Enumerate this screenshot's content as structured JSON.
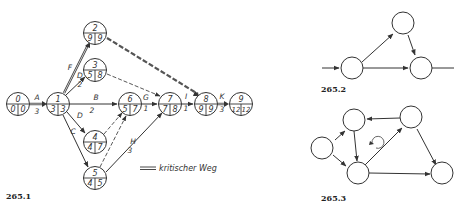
{
  "figures": [
    {
      "id": "265.1",
      "caption": "265.1",
      "legend": {
        "symbol": "double-line",
        "label": "kritischer Weg"
      },
      "nodes": [
        {
          "n": "0",
          "early": "0",
          "late": "0"
        },
        {
          "n": "1",
          "early": "3",
          "late": "3"
        },
        {
          "n": "2",
          "early": "9",
          "late": "9"
        },
        {
          "n": "3",
          "early": "5",
          "late": "8"
        },
        {
          "n": "4",
          "early": "4",
          "late": "7"
        },
        {
          "n": "5",
          "early": "4",
          "late": "5"
        },
        {
          "n": "6",
          "early": "5",
          "late": "7"
        },
        {
          "n": "7",
          "early": "7",
          "late": "8"
        },
        {
          "n": "8",
          "early": "9",
          "late": "9"
        },
        {
          "n": "9",
          "early": "12",
          "late": "12"
        }
      ],
      "activities": [
        {
          "name": "A",
          "duration": "3",
          "from": "0",
          "to": "1",
          "critical": true
        },
        {
          "name": "F",
          "duration": "",
          "from": "1",
          "to": "2",
          "critical": true
        },
        {
          "name": "D",
          "duration": "2",
          "from": "1",
          "to": "3",
          "critical": false
        },
        {
          "name": "B",
          "duration": "2",
          "from": "1",
          "to": "6",
          "critical": false
        },
        {
          "name": "D",
          "duration": "",
          "from": "1",
          "to": "4",
          "critical": false
        },
        {
          "name": "C",
          "duration": "",
          "from": "1",
          "to": "5",
          "critical": false
        },
        {
          "name": "G",
          "duration": "1",
          "from": "6",
          "to": "7",
          "critical": false
        },
        {
          "name": "H",
          "duration": "3",
          "from": "5",
          "to": "7",
          "critical": false
        },
        {
          "name": "I",
          "duration": "1",
          "from": "7",
          "to": "8",
          "critical": false
        },
        {
          "name": "K",
          "duration": "3",
          "from": "8",
          "to": "9",
          "critical": true
        }
      ],
      "dummy_edges": [
        {
          "from": "2",
          "to": "8",
          "critical": true
        },
        {
          "from": "3",
          "to": "7"
        },
        {
          "from": "4",
          "to": "6"
        },
        {
          "from": "5",
          "to": "6"
        }
      ]
    },
    {
      "id": "265.2",
      "caption": "265.2",
      "description": "Three-node network with entry and exit arrows"
    },
    {
      "id": "265.3",
      "caption": "265.3",
      "description": "Five-node network containing a cycle (loop marker)"
    }
  ]
}
